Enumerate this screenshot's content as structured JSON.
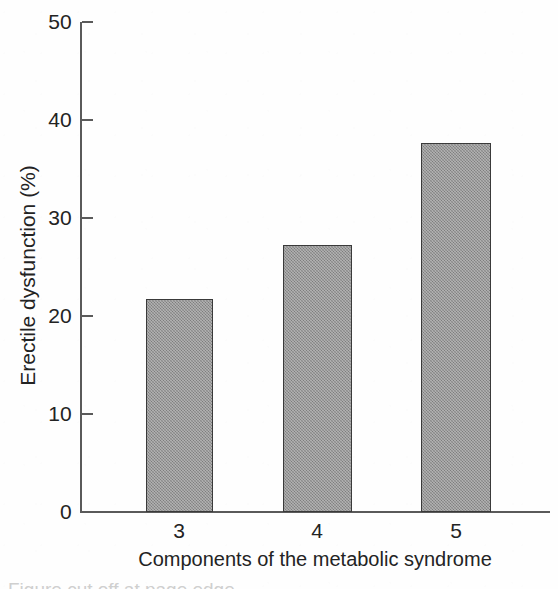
{
  "chart_data": {
    "type": "bar",
    "title": "",
    "subtitle": "",
    "categories": [
      "3",
      "4",
      "5"
    ],
    "values": [
      21.7,
      27.2,
      37.7
    ],
    "series": [
      {
        "name": "Erectile dysfunction",
        "values": [
          21.7,
          27.2,
          37.7
        ]
      }
    ],
    "xlabel": "Components of the metabolic syndrome",
    "ylabel": "Erectile dysfunction (%)",
    "ylim": [
      0,
      50
    ],
    "yticks": [
      0,
      10,
      20,
      30,
      40,
      50
    ],
    "ytick_labels": [
      "0",
      "10",
      "20",
      "30",
      "40",
      "50"
    ],
    "xtick_labels": [
      "3",
      "4",
      "5"
    ],
    "grid": false,
    "legend": false,
    "legend_position": "none",
    "bar_fill_color": "#949494",
    "bar_edge_color": "#3a3a3a",
    "axis_color": "#5a5a5a",
    "text_color": "#232323",
    "background_color": "#ffffff"
  },
  "axes": {
    "y_title": "Erectile dysfunction (%)",
    "x_title": "Components of the metabolic syndrome",
    "y_ticks": [
      {
        "label": "50",
        "value": 50
      },
      {
        "label": "40",
        "value": 40
      },
      {
        "label": "30",
        "value": 30
      },
      {
        "label": "20",
        "value": 20
      },
      {
        "label": "10",
        "value": 10
      },
      {
        "label": "0",
        "value": 0
      }
    ],
    "x_ticks": [
      {
        "label": "3"
      },
      {
        "label": "4"
      },
      {
        "label": "5"
      }
    ]
  },
  "caption": {
    "cut_off_text": "Figure cut off at page edge"
  }
}
